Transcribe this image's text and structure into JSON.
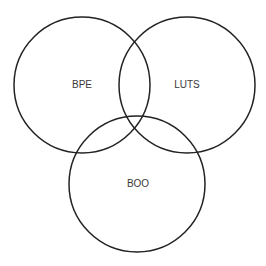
{
  "diagram": {
    "type": "venn",
    "stroke_color": "#222222",
    "fill_color": "none",
    "sets": [
      {
        "id": "bpe",
        "label": "BPE",
        "cx": 82,
        "cy": 85,
        "r": 68,
        "label_x": 82,
        "label_y": 88
      },
      {
        "id": "luts",
        "label": "LUTS",
        "cx": 187,
        "cy": 85,
        "r": 68,
        "label_x": 187,
        "label_y": 88
      },
      {
        "id": "boo",
        "label": "BOO",
        "cx": 137,
        "cy": 184,
        "r": 68,
        "label_x": 138,
        "label_y": 187
      }
    ]
  }
}
